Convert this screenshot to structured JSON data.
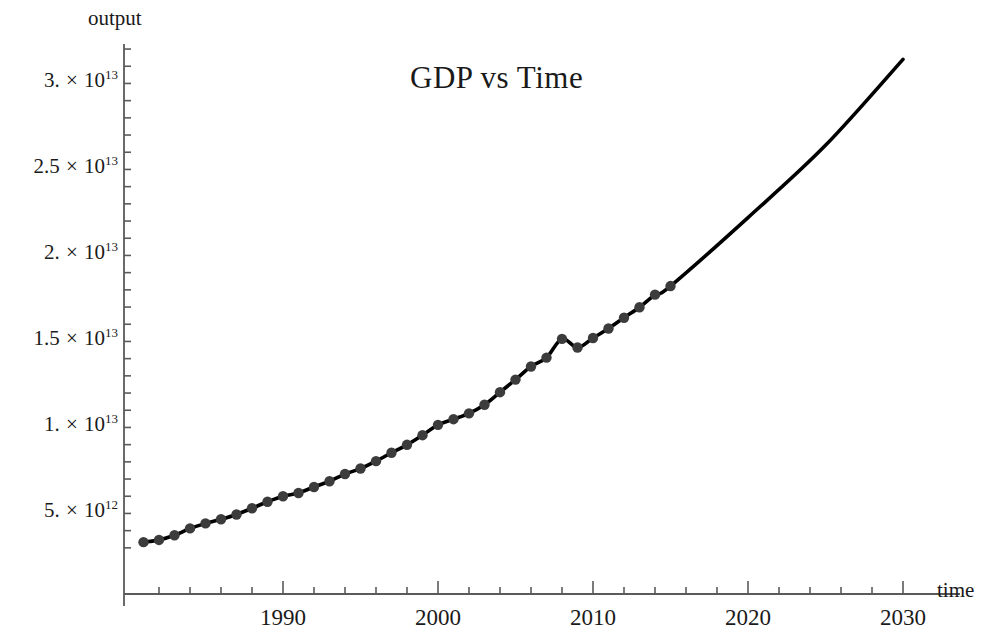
{
  "figure": {
    "title": "GDP vs Time",
    "background": "#ffffff",
    "axis_color": "#5a5a5a",
    "line_color": "#000000",
    "point_color": "#3c3c3c"
  },
  "axes": {
    "y_axis_label": "output",
    "x_axis_label": "time",
    "x_ticks": [
      {
        "value": 1990,
        "label": "1990"
      },
      {
        "value": 2000,
        "label": "2000"
      },
      {
        "value": 2010,
        "label": "2010"
      },
      {
        "value": 2020,
        "label": "2020"
      },
      {
        "value": 2030,
        "label": "2030"
      }
    ],
    "x_minor_step": 2,
    "y_ticks": [
      {
        "value": 5000000000000.0,
        "mantissa": "5.",
        "times": "×",
        "base": "10",
        "exponent": "12"
      },
      {
        "value": 10000000000000.0,
        "mantissa": "1.",
        "times": "×",
        "base": "10",
        "exponent": "13"
      },
      {
        "value": 15000000000000.0,
        "mantissa": "1.5",
        "times": "×",
        "base": "10",
        "exponent": "13"
      },
      {
        "value": 20000000000000.0,
        "mantissa": "2.",
        "times": "×",
        "base": "10",
        "exponent": "13"
      },
      {
        "value": 25000000000000.0,
        "mantissa": "2.5",
        "times": "×",
        "base": "10",
        "exponent": "13"
      },
      {
        "value": 30000000000000.0,
        "mantissa": "3.",
        "times": "×",
        "base": "10",
        "exponent": "13"
      }
    ],
    "y_minor_per_major": 5,
    "xlim": [
      1981,
      2032
    ],
    "ylim": [
      2600000000000,
      32500000000000
    ],
    "grid": false,
    "legend": "none"
  },
  "chart_data": {
    "type": "line",
    "title": "GDP vs Time",
    "xlabel": "time",
    "ylabel": "output",
    "xlim": [
      1981,
      2032
    ],
    "ylim": [
      2600000000000,
      32500000000000
    ],
    "grid": false,
    "legend_position": "none",
    "series": [
      {
        "name": "GDP (observed)",
        "style": "points-with-line",
        "point_color": "#3c3c3c",
        "x": [
          1981,
          1982,
          1983,
          1984,
          1985,
          1986,
          1987,
          1988,
          1989,
          1990,
          1991,
          1992,
          1993,
          1994,
          1995,
          1996,
          1997,
          1998,
          1999,
          2000,
          2001,
          2002,
          2003,
          2004,
          2005,
          2006,
          2007,
          2008,
          2009,
          2010,
          2011,
          2012,
          2013,
          2014,
          2015
        ],
        "values": [
          3130000000000.0,
          3260000000000.0,
          3530000000000.0,
          3930000000000.0,
          4220000000000.0,
          4460000000000.0,
          4740000000000.0,
          5100000000000.0,
          5480000000000.0,
          5800000000000.0,
          5990000000000.0,
          6340000000000.0,
          6670000000000.0,
          7090000000000.0,
          7410000000000.0,
          7840000000000.0,
          8330000000000.0,
          8790000000000.0,
          9350000000000.0,
          9950000000000.0,
          10280000000000.0,
          10620000000000.0,
          11120000000000.0,
          11850000000000.0,
          12580000000000.0,
          13340000000000.0,
          13860000000000.0,
          14950000000000.0,
          14450000000000.0,
          15000000000000.0,
          15550000000000.0,
          16180000000000.0,
          16790000000000.0,
          17520000000000.0,
          18020000000000.0
        ]
      },
      {
        "name": "Model / projection",
        "style": "line",
        "line_color": "#000000",
        "x": [
          1981,
          1985,
          1990,
          1995,
          2000,
          2005,
          2008,
          2009,
          2010,
          2015,
          2020,
          2025,
          2030
        ],
        "values": [
          3130000000000.0,
          4220000000000.0,
          5800000000000.0,
          7410000000000.0,
          9950000000000.0,
          12580000000000.0,
          14950000000000.0,
          14450000000000.0,
          15000000000000.0,
          18020000000000.0,
          22000000000000.0,
          26200000000000.0,
          31200000000000.0
        ]
      }
    ],
    "annotations": [
      {
        "text": "2008-2009 dip",
        "x": 2008.5,
        "y": 14700000000000.0,
        "rendered": false
      }
    ]
  }
}
